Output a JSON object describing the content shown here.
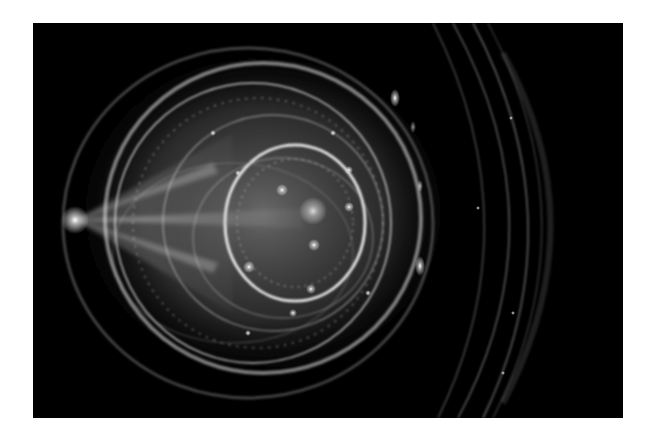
{
  "image": {
    "subject": "abstract grayscale fractal flame with concentric glowing rings",
    "background": "#ffffff",
    "frame_color": "#000000",
    "glow_color": "#ffffff",
    "focal_point_label": "bright convergence point on left",
    "rings_label": "concentric elliptical rings",
    "outer_arcs_label": "faint outer arcs on right"
  }
}
